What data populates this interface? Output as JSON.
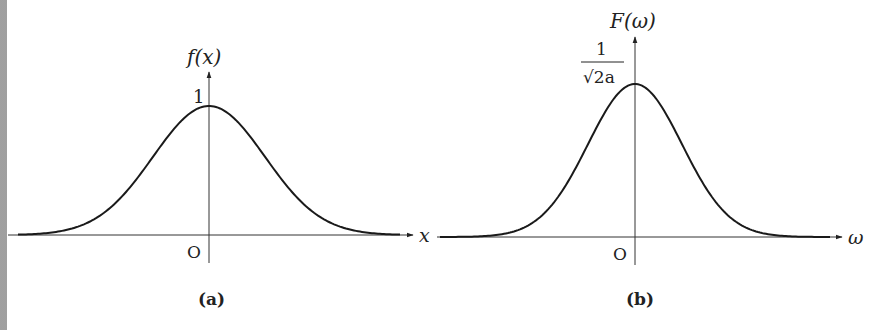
{
  "figure": {
    "panel_a": {
      "caption": "(a)",
      "y_label": "f(x)",
      "x_label": "x",
      "origin_label": "O",
      "peak_label": "1"
    },
    "panel_b": {
      "caption": "(b)",
      "y_label": "F(ω)",
      "x_label": "ω",
      "origin_label": "O",
      "peak_label_numerator": "1",
      "peak_label_denominator": "√2a"
    },
    "colors": {
      "curve": "#1a1a1a",
      "axis": "#333333",
      "border": "#9a9a9a"
    }
  },
  "chart_data": [
    {
      "type": "line",
      "title": "(a)",
      "xlabel": "x",
      "ylabel": "f(x)",
      "description": "Gaussian pulse centered at origin, peak value 1",
      "series": [
        {
          "name": "f(x)",
          "x": [
            -3,
            -2,
            -1.5,
            -1,
            -0.5,
            0,
            0.5,
            1,
            1.5,
            2,
            3
          ],
          "values": [
            0.0001,
            0.018,
            0.105,
            0.368,
            0.779,
            1,
            0.779,
            0.368,
            0.105,
            0.018,
            0.0001
          ]
        }
      ],
      "yticks": [
        "1"
      ],
      "xticks": [
        "O"
      ],
      "grid": false
    },
    {
      "type": "line",
      "title": "(b)",
      "xlabel": "ω",
      "ylabel": "F(ω)",
      "description": "Gaussian spectrum centered at origin, peak value 1/√(2a), narrower than (a)",
      "series": [
        {
          "name": "F(ω)",
          "x": [
            -3,
            -2,
            -1.5,
            -1,
            -0.5,
            0,
            0.5,
            1,
            1.5,
            2,
            3
          ],
          "values": [
            0.0,
            0.004,
            0.04,
            0.2,
            0.61,
            1,
            0.61,
            0.2,
            0.04,
            0.004,
            0.0
          ]
        }
      ],
      "yticks": [
        "1/√2a"
      ],
      "xticks": [
        "O"
      ],
      "grid": false
    }
  ]
}
